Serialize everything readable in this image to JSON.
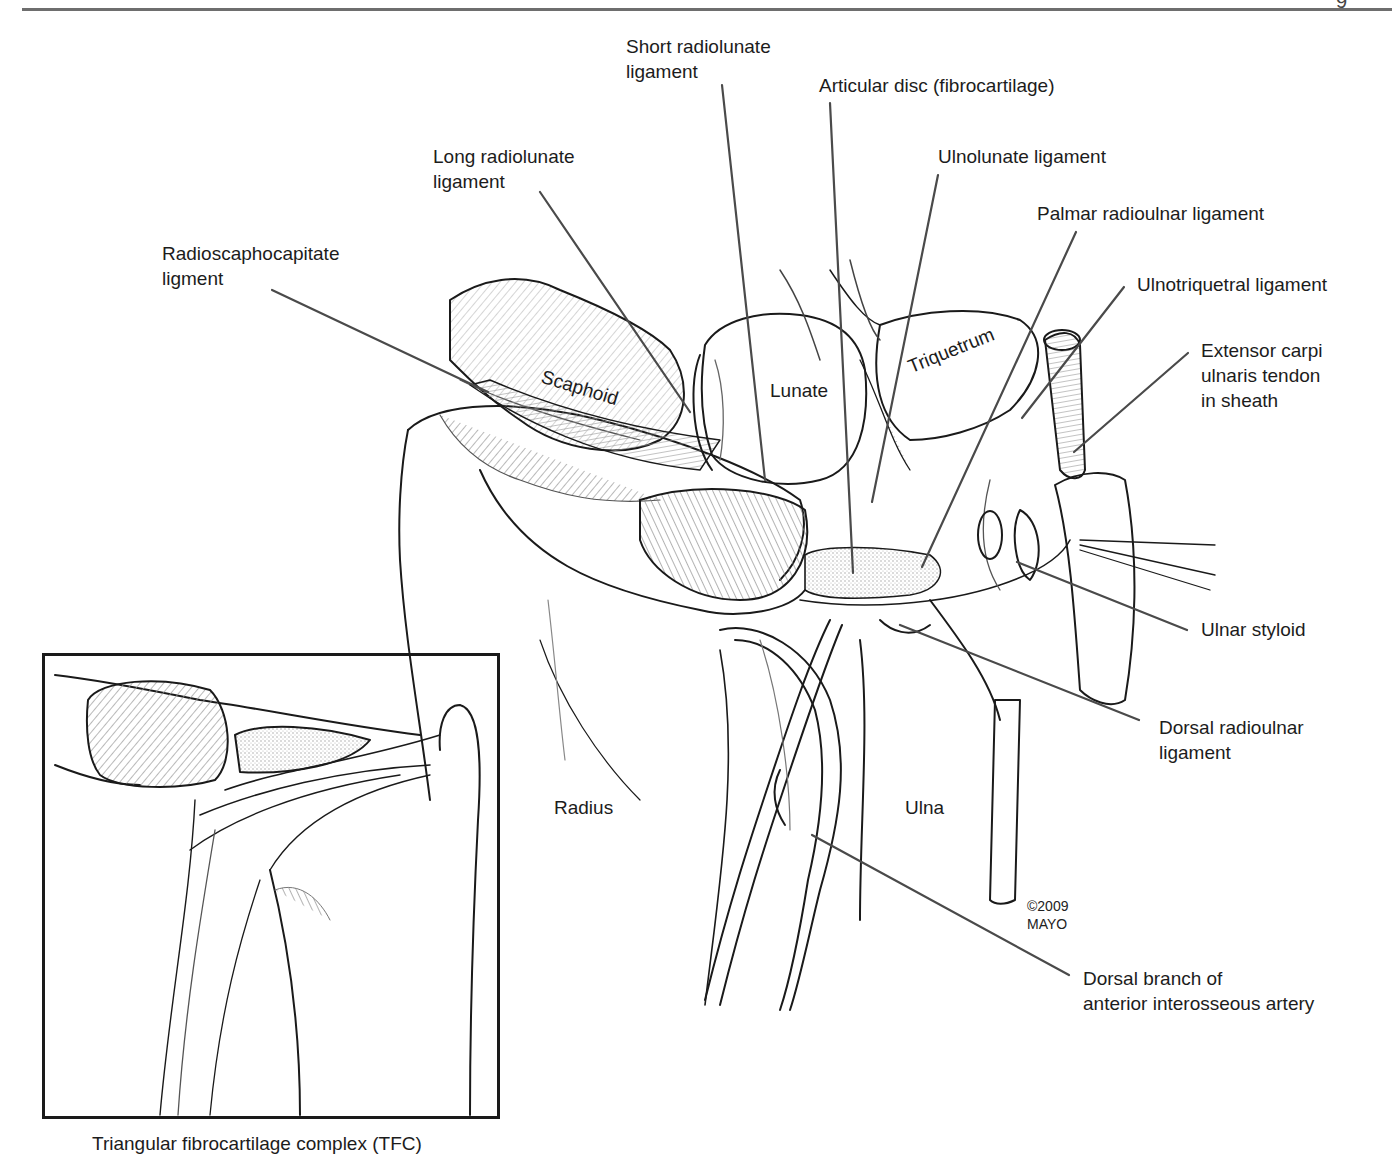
{
  "page": {
    "page_mark": "9",
    "colors": {
      "ink": "#1a1a1a",
      "leader": "#4a4a4a",
      "rule": "#6e6e6e",
      "hatch": "#8a8a8a",
      "background": "#ffffff"
    }
  },
  "figure": {
    "labels": {
      "short_radiolunate": [
        "Short radiolunate",
        "ligament"
      ],
      "articular_disc": [
        "Articular disc (fibrocartilage)"
      ],
      "long_radiolunate": [
        "Long radiolunate",
        "ligament"
      ],
      "ulnolunate": [
        "Ulnolunate ligament"
      ],
      "palmar_radioulnar": [
        "Palmar radioulnar ligament"
      ],
      "radioscaphocapitate": [
        "Radioscaphocapitate",
        "ligment"
      ],
      "ulnotriquetral": [
        "Ulnotriquetral ligament"
      ],
      "ecu_tendon": [
        "Extensor carpi",
        "ulnaris tendon",
        "in sheath"
      ],
      "ulnar_styloid": [
        "Ulnar styloid"
      ],
      "dorsal_radioulnar": [
        "Dorsal radioulnar",
        "ligament"
      ],
      "dorsal_branch": [
        "Dorsal branch of",
        "anterior interosseous artery"
      ]
    },
    "bones": {
      "scaphoid": "Scaphoid",
      "lunate": "Lunate",
      "triquetrum": "Triquetrum",
      "radius": "Radius",
      "ulna": "Ulna"
    },
    "copyright": [
      "©2009",
      "MAYO"
    ]
  },
  "inset": {
    "caption": "Triangular fibrocartilage complex (TFC)"
  }
}
